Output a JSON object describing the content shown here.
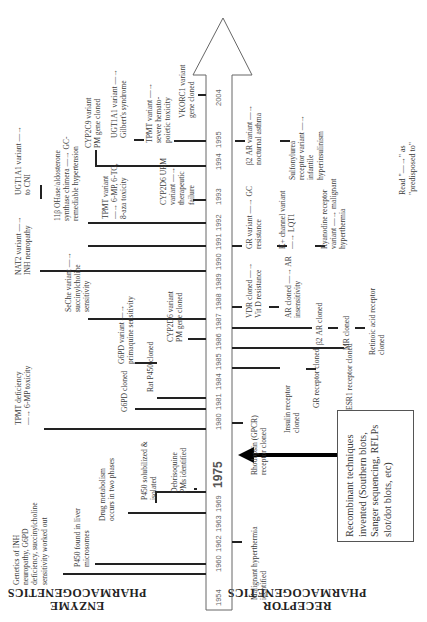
{
  "headers": {
    "enzyme": "ENZYME\nPHARMACOGENETICS",
    "receptor": "RECEPTOR\nPHARMACOGENETICS"
  },
  "note": "Read \"—→\" as\n\"predisposed to\"",
  "recombinant_box": "Recombinant techniques\ninvented (Southern blots,\nSanger sequencing, RFLPs\nslot/dot blots, etc)",
  "timeline": {
    "years": [
      "1954",
      "1960",
      "1962",
      "1963",
      "1969",
      "1975",
      "1980",
      "1981",
      "1984",
      "1985",
      "1986",
      "1987",
      "1988",
      "1989",
      "1990",
      "1991",
      "1992",
      "1993",
      "1994",
      "1995",
      "2004"
    ],
    "highlight_year": "1975"
  },
  "enzyme_events": [
    {
      "year": "1954",
      "text": "Genetics of INH\nneuropathy, G6PD\ndeficiency, succinylcholine\nsensitivity worked out"
    },
    {
      "year": "1960",
      "text": "P450 found in liver\nmicrosomes"
    },
    {
      "year": "1963",
      "text": "Drug metabolism\noccurs in two phases"
    },
    {
      "year": "1969",
      "text": "P450 solubilized &\nisolated"
    },
    {
      "year": "1975",
      "text": "Debrisoquine\nPMs identified"
    },
    {
      "year": "1980",
      "text": "TPMT deficiency\n—→ 6-MP toxicity"
    },
    {
      "year": "1981",
      "text": "G6PD cloned"
    },
    {
      "year": "1984",
      "text": "Rat P450 cloned"
    },
    {
      "year": "1985",
      "text": "G6PD variant —→\nprimaquine sensitivity"
    },
    {
      "year": "1986",
      "text": "SeChe variant —→\nsuccinylcholine\nsensitivity"
    },
    {
      "year": "1987",
      "text": "CYP2D6 variant\nPM gene cloned"
    },
    {
      "year": "1989",
      "text": "NAT2 variant —→\nINH neuropathy"
    },
    {
      "year": "1991",
      "text": "CYP2D6 URM\nvariant —→\ntherapeutic\nfailure"
    },
    {
      "year": "1992",
      "text": "TPMT variant\n—→ 6-MP, 6-TG,\n8-aza toxicity"
    },
    {
      "year": "1992b",
      "text": "11β OHase/aldosterone\nsynthase chimera —→ GC-\nremediable hypertension"
    },
    {
      "year": "1993",
      "text": "UGT1A1 variant —→\nto CNI"
    },
    {
      "year": "1994",
      "text": "CYP2C9 variant\nPM gene cloned"
    },
    {
      "year": "1995",
      "text": "UGT1A1 variant —→\nGilbert's syndrome"
    },
    {
      "year": "1995b",
      "text": "TPMT variant —→\nsevere hemato-\npoietic toxicity"
    },
    {
      "year": "2004",
      "text": "VKORC1 variant\ngene cloned"
    }
  ],
  "receptor_events": [
    {
      "year": "1960",
      "text": "Malignant hyperthermia\nidentified"
    },
    {
      "year": "1980",
      "text": "Rhodopsin (GPCR)\nreceptor cloned"
    },
    {
      "year": "1984",
      "text": "Insulin receptor\ncloned"
    },
    {
      "year": "1985",
      "text": "GR receptor cloned"
    },
    {
      "year": "1986",
      "text": "ESR1 receptor cloned"
    },
    {
      "year": "1987a",
      "text": "β2 AR cloned"
    },
    {
      "year": "1987b",
      "text": "MR cloned"
    },
    {
      "year": "1987c",
      "text": "Retinoic acid receptor\ncloned"
    },
    {
      "year": "1988",
      "text": "VDR cloned —→\nVit D resistance"
    },
    {
      "year": "1989",
      "text": "AR cloned —→ AR\ninsensitivity"
    },
    {
      "year": "1991a",
      "text": "GR variant —→ GC\nresistance"
    },
    {
      "year": "1991b",
      "text": "K+ channel variant\n—→ LQT1"
    },
    {
      "year": "1991c",
      "text": "Ryanodine receptor\nvariant —→ malignant\nhyperthermia"
    },
    {
      "year": "1995a",
      "text": "β2 AR variant —→\nnocturnal asthma"
    },
    {
      "year": "1995b",
      "text": "Sulfonylurea\nreceptor variant —→\ninfantile\nhyperinsulinism"
    }
  ]
}
